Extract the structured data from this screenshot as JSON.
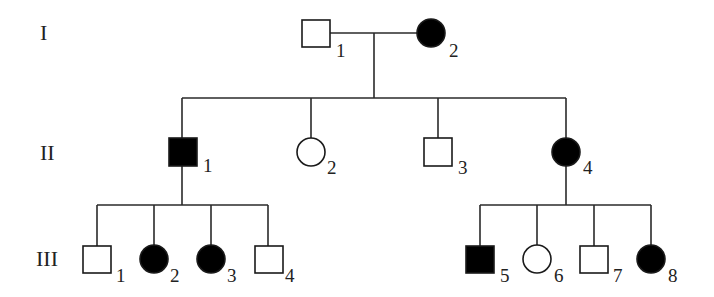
{
  "diagram": {
    "type": "pedigree",
    "colors": {
      "affected": "#000000",
      "unaffected": "#ffffff",
      "line": "#2a2a2a"
    },
    "generations": [
      {
        "label": "I",
        "members": [
          {
            "id": "I-1",
            "num": "1",
            "sex": "male",
            "affected": false
          },
          {
            "id": "I-2",
            "num": "2",
            "sex": "female",
            "affected": true
          }
        ]
      },
      {
        "label": "II",
        "members": [
          {
            "id": "II-1",
            "num": "1",
            "sex": "male",
            "affected": true
          },
          {
            "id": "II-2",
            "num": "2",
            "sex": "female",
            "affected": false
          },
          {
            "id": "II-3",
            "num": "3",
            "sex": "male",
            "affected": false
          },
          {
            "id": "II-4",
            "num": "4",
            "sex": "female",
            "affected": true
          }
        ]
      },
      {
        "label": "III",
        "members": [
          {
            "id": "III-1",
            "num": "1",
            "sex": "male",
            "affected": false,
            "parent": "II-1"
          },
          {
            "id": "III-2",
            "num": "2",
            "sex": "female",
            "affected": true,
            "parent": "II-1"
          },
          {
            "id": "III-3",
            "num": "3",
            "sex": "female",
            "affected": true,
            "parent": "II-1"
          },
          {
            "id": "III-4",
            "num": "4",
            "sex": "male",
            "affected": false,
            "parent": "II-1"
          },
          {
            "id": "III-5",
            "num": "5",
            "sex": "male",
            "affected": true,
            "parent": "II-4"
          },
          {
            "id": "III-6",
            "num": "6",
            "sex": "female",
            "affected": false,
            "parent": "II-4"
          },
          {
            "id": "III-7",
            "num": "7",
            "sex": "male",
            "affected": false,
            "parent": "II-4"
          },
          {
            "id": "III-8",
            "num": "8",
            "sex": "female",
            "affected": true,
            "parent": "II-4"
          }
        ]
      }
    ]
  }
}
